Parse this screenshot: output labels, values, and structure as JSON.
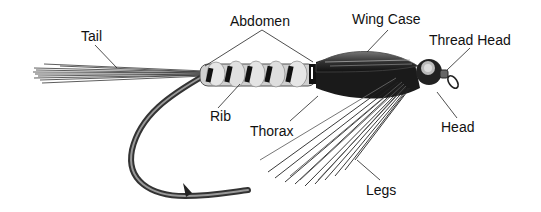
{
  "diagram": {
    "labels": {
      "tail": "Tail",
      "abdomen": "Abdomen",
      "wing_case": "Wing Case",
      "thread_head": "Thread Head",
      "rib": "Rib",
      "thorax": "Thorax",
      "head": "Head",
      "legs": "Legs"
    },
    "colors": {
      "ink": "#111111",
      "background": "#ffffff",
      "abdomen_light": "#d8d8d8",
      "body_dark": "#1a1a1a"
    }
  }
}
